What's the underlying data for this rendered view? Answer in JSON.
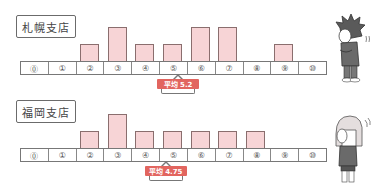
{
  "chart_data": [
    {
      "type": "bar",
      "title": "札幌支店",
      "categories": [
        "⓪",
        "①",
        "②",
        "③",
        "④",
        "⑤",
        "⑥",
        "⑦",
        "⑧",
        "⑨",
        "⑩"
      ],
      "x": [
        0,
        1,
        2,
        3,
        4,
        5,
        6,
        7,
        8,
        9,
        10
      ],
      "values": [
        0,
        0,
        1,
        2,
        1,
        1,
        2,
        2,
        0,
        1,
        0
      ],
      "mean_label": "平均 5.2",
      "mean": 5.2,
      "xlabel": "",
      "ylabel": "",
      "grid": false
    },
    {
      "type": "bar",
      "title": "福岡支店",
      "categories": [
        "⓪",
        "①",
        "②",
        "③",
        "④",
        "⑤",
        "⑥",
        "⑦",
        "⑧",
        "⑨",
        "⑩"
      ],
      "x": [
        0,
        1,
        2,
        3,
        4,
        5,
        6,
        7,
        8,
        9,
        10
      ],
      "values": [
        0,
        0,
        1,
        2,
        1,
        1,
        1,
        1,
        1,
        0,
        0
      ],
      "mean_label": "平均 4.75",
      "mean": 4.75,
      "xlabel": "",
      "ylabel": "",
      "grid": false
    }
  ],
  "panels": [
    {
      "title": "札幌支店",
      "mean_label": "平均 5.2",
      "character": "boy-thinking-icon"
    },
    {
      "title": "福岡支店",
      "mean_label": "平均 4.75",
      "character": "girl-thinking-icon"
    }
  ],
  "scale_labels": [
    "⓪",
    "①",
    "②",
    "③",
    "④",
    "⑤",
    "⑥",
    "⑦",
    "⑧",
    "⑨",
    "⑩"
  ],
  "colors": {
    "bar_fill": "#f7d4d6",
    "bar_stroke": "#8a6e6e",
    "badge": "#e2655f"
  }
}
